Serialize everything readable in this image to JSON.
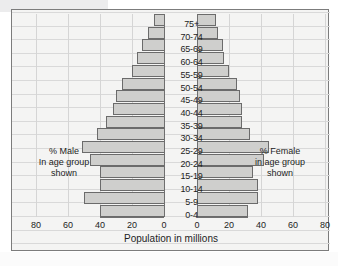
{
  "chart_data": {
    "type": "bar",
    "subtype": "population-pyramid",
    "title": "",
    "xlabel": "Population in millions",
    "ylabel": "",
    "categories": [
      "0-4",
      "5-9",
      "10-14",
      "15-19",
      "20-24",
      "25-29",
      "30-34",
      "35-39",
      "40-44",
      "45-49",
      "50-54",
      "55-59",
      "60-64",
      "65-69",
      "70-74",
      "75+"
    ],
    "series": [
      {
        "name": "% Male in age group shown",
        "side": "left",
        "values": [
          40,
          50,
          40,
          40,
          46,
          51,
          42,
          36,
          32,
          30,
          26,
          20,
          17,
          14,
          10,
          6
        ]
      },
      {
        "name": "% Female in age group shown",
        "side": "right",
        "values": [
          32,
          38,
          38,
          35,
          42,
          45,
          33,
          28,
          28,
          27,
          25,
          20,
          17,
          16,
          13,
          12
        ]
      }
    ],
    "xticks_left": [
      "80",
      "60",
      "40",
      "20",
      "0"
    ],
    "xticks_right": [
      "0",
      "20",
      "40",
      "60",
      "80"
    ],
    "xlim": [
      0,
      80
    ],
    "xtick_step": 20,
    "grid": true,
    "legend_position": "inline-sides",
    "bar_fill_color": "#cfcfcd",
    "bar_border_color": "#6b6b6b",
    "panel_color": "#f4f4f3"
  },
  "annotations": {
    "left": {
      "line1": "% Male",
      "line2": "In age group",
      "line3": "shown"
    },
    "right": {
      "line1": "% Female",
      "line2": "in age group",
      "line3": "shown"
    }
  },
  "axis": {
    "title": "Population in millions"
  }
}
